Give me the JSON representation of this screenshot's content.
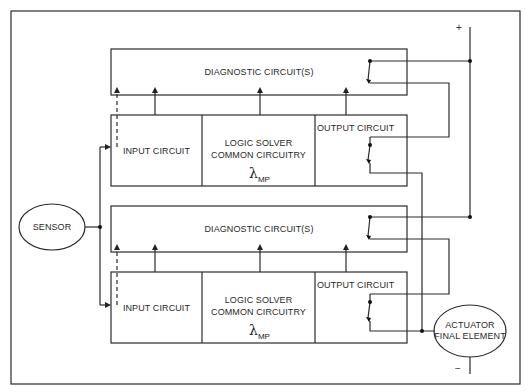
{
  "diagram": {
    "type": "block-diagram",
    "title": "",
    "channels": [
      {
        "id": "channel-1",
        "diagnostic_label": "DIAGNOSTIC CIRCUIT(S)",
        "input_label": "INPUT CIRCUIT",
        "logic_label_line1": "LOGIC SOLVER",
        "logic_label_line2": "COMMON CIRCUITRY",
        "lambda_symbol": "λ",
        "lambda_subscript": "MP",
        "output_label": "OUTPUT CIRCUIT"
      },
      {
        "id": "channel-2",
        "diagnostic_label": "DIAGNOSTIC CIRCUIT(S)",
        "input_label": "INPUT CIRCUIT",
        "logic_label_line1": "LOGIC SOLVER",
        "logic_label_line2": "COMMON CIRCUITRY",
        "lambda_symbol": "λ",
        "lambda_subscript": "MP",
        "output_label": "OUTPUT CIRCUIT"
      }
    ],
    "sensor_label": "SENSOR",
    "actuator_label_line1": "ACTUATOR",
    "actuator_label_line2": "FINAL ELEMENT",
    "positive_terminal": "+",
    "negative_terminal": "−",
    "colors": {
      "line": "#2b2b2b",
      "background": "#ffffff"
    }
  }
}
